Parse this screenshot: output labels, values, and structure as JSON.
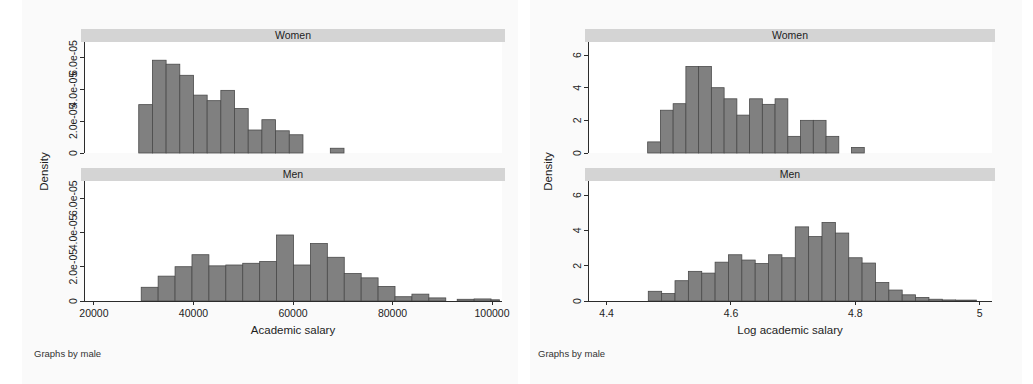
{
  "figure_left": {
    "note": "Graphs by male",
    "xlabel": "Academic salary",
    "ylabel": "Density",
    "panels": [
      {
        "title": "Women"
      },
      {
        "title": "Men"
      }
    ]
  },
  "figure_right": {
    "note": "Graphs by male",
    "xlabel": "Log academic salary",
    "ylabel": "Density",
    "panels": [
      {
        "title": "Women"
      },
      {
        "title": "Men"
      }
    ]
  },
  "colors": {
    "bar_fill": "#808080",
    "bar_stroke": "#4a4a4a",
    "strip": "#d4d4d4",
    "panel_bg": "#ffffff",
    "figure_bg": "#fafafa",
    "axis": "#2b2b2b"
  },
  "chart_data": [
    {
      "id": "salary-women",
      "type": "bar",
      "title": "Women",
      "subtitle": "Graphs by male",
      "xlabel": "Academic salary",
      "ylabel": "Density",
      "xlim": [
        18000,
        102000
      ],
      "ylim": [
        0,
        7e-05
      ],
      "xticks": [
        20000,
        40000,
        60000,
        80000,
        100000
      ],
      "xtick_labels": [
        "20000",
        "40000",
        "60000",
        "80000",
        "100000"
      ],
      "yticks": [
        0,
        2e-05,
        4e-05,
        6e-05
      ],
      "ytick_labels": [
        "0",
        "2.0e-05",
        "4.0e-05",
        "6.0e-05"
      ],
      "grid": false,
      "legend": "none",
      "bin_width": 2750,
      "bins": [
        {
          "x0": 29000,
          "x1": 31750,
          "density": 3.05e-05
        },
        {
          "x0": 31750,
          "x1": 34500,
          "density": 5.85e-05
        },
        {
          "x0": 34500,
          "x1": 37250,
          "density": 5.6e-05
        },
        {
          "x0": 37250,
          "x1": 40000,
          "density": 4.9e-05
        },
        {
          "x0": 40000,
          "x1": 42750,
          "density": 3.65e-05
        },
        {
          "x0": 42750,
          "x1": 45500,
          "density": 3.3e-05
        },
        {
          "x0": 45500,
          "x1": 48250,
          "density": 3.95e-05
        },
        {
          "x0": 48250,
          "x1": 51000,
          "density": 2.8e-05
        },
        {
          "x0": 51000,
          "x1": 53750,
          "density": 1.45e-05
        },
        {
          "x0": 53750,
          "x1": 56500,
          "density": 2.1e-05
        },
        {
          "x0": 56500,
          "x1": 59250,
          "density": 1.4e-05
        },
        {
          "x0": 59250,
          "x1": 62000,
          "density": 1.15e-05
        },
        {
          "x0": 67500,
          "x1": 70250,
          "density": 3e-06
        }
      ]
    },
    {
      "id": "salary-men",
      "type": "bar",
      "title": "Men",
      "subtitle": "Graphs by male",
      "xlabel": "Academic salary",
      "ylabel": "Density",
      "xlim": [
        18000,
        102000
      ],
      "ylim": [
        0,
        7e-05
      ],
      "xticks": [
        20000,
        40000,
        60000,
        80000,
        100000
      ],
      "xtick_labels": [
        "20000",
        "40000",
        "60000",
        "80000",
        "100000"
      ],
      "yticks": [
        0,
        2e-05,
        4e-05,
        6e-05
      ],
      "ytick_labels": [
        "0",
        "2.0e-05",
        "4.0e-05",
        "6.0e-05"
      ],
      "grid": false,
      "legend": "none",
      "bin_width": 3400,
      "bins": [
        {
          "x0": 29500,
          "x1": 32900,
          "density": 8e-06
        },
        {
          "x0": 32900,
          "x1": 36300,
          "density": 1.45e-05
        },
        {
          "x0": 36300,
          "x1": 39700,
          "density": 2e-05
        },
        {
          "x0": 39700,
          "x1": 43100,
          "density": 2.7e-05
        },
        {
          "x0": 43100,
          "x1": 46500,
          "density": 2.05e-05
        },
        {
          "x0": 46500,
          "x1": 49900,
          "density": 2.1e-05
        },
        {
          "x0": 49900,
          "x1": 53300,
          "density": 2.2e-05
        },
        {
          "x0": 53300,
          "x1": 56700,
          "density": 2.3e-05
        },
        {
          "x0": 56700,
          "x1": 60100,
          "density": 3.85e-05
        },
        {
          "x0": 60100,
          "x1": 63500,
          "density": 2.1e-05
        },
        {
          "x0": 63500,
          "x1": 66900,
          "density": 3.35e-05
        },
        {
          "x0": 66900,
          "x1": 70300,
          "density": 2.55e-05
        },
        {
          "x0": 70300,
          "x1": 73700,
          "density": 1.6e-05
        },
        {
          "x0": 73700,
          "x1": 77100,
          "density": 1.35e-05
        },
        {
          "x0": 77100,
          "x1": 80500,
          "density": 8.5e-06
        },
        {
          "x0": 80500,
          "x1": 83900,
          "density": 2.5e-06
        },
        {
          "x0": 83900,
          "x1": 87300,
          "density": 4e-06
        },
        {
          "x0": 87300,
          "x1": 90700,
          "density": 1.8e-06
        },
        {
          "x0": 93000,
          "x1": 96400,
          "density": 1e-06
        },
        {
          "x0": 96400,
          "x1": 99800,
          "density": 1.2e-06
        },
        {
          "x0": 99800,
          "x1": 101500,
          "density": 7e-07
        }
      ]
    },
    {
      "id": "logsalary-women",
      "type": "bar",
      "title": "Women",
      "subtitle": "Graphs by male",
      "xlabel": "Log academic salary",
      "ylabel": "Density",
      "xlim": [
        4.37,
        5.02
      ],
      "ylim": [
        0,
        6.8
      ],
      "xticks": [
        4.4,
        4.6,
        4.8,
        5.0
      ],
      "xtick_labels": [
        "4.4",
        "4.6",
        "4.8",
        "5"
      ],
      "yticks": [
        0,
        2,
        4,
        6
      ],
      "ytick_labels": [
        "0",
        "2",
        "4",
        "6"
      ],
      "grid": false,
      "legend": "none",
      "bin_width": 0.0205,
      "bins": [
        {
          "x0": 4.466,
          "x1": 4.4865,
          "density": 0.68
        },
        {
          "x0": 4.4865,
          "x1": 4.507,
          "density": 2.62
        },
        {
          "x0": 4.507,
          "x1": 4.5275,
          "density": 3.02
        },
        {
          "x0": 4.5275,
          "x1": 4.548,
          "density": 5.3
        },
        {
          "x0": 4.548,
          "x1": 4.5685,
          "density": 5.3
        },
        {
          "x0": 4.5685,
          "x1": 4.589,
          "density": 4.0
        },
        {
          "x0": 4.589,
          "x1": 4.6095,
          "density": 3.32
        },
        {
          "x0": 4.6095,
          "x1": 4.63,
          "density": 2.32
        },
        {
          "x0": 4.63,
          "x1": 4.6505,
          "density": 3.32
        },
        {
          "x0": 4.6505,
          "x1": 4.671,
          "density": 2.98
        },
        {
          "x0": 4.671,
          "x1": 4.6915,
          "density": 3.32
        },
        {
          "x0": 4.6915,
          "x1": 4.712,
          "density": 1.02
        },
        {
          "x0": 4.712,
          "x1": 4.7325,
          "density": 2.0
        },
        {
          "x0": 4.7325,
          "x1": 4.753,
          "density": 2.0
        },
        {
          "x0": 4.753,
          "x1": 4.7735,
          "density": 1.02
        },
        {
          "x0": 4.794,
          "x1": 4.8145,
          "density": 0.34
        }
      ]
    },
    {
      "id": "logsalary-men",
      "type": "bar",
      "title": "Men",
      "subtitle": "Graphs by male",
      "xlabel": "Log academic salary",
      "ylabel": "Density",
      "xlim": [
        4.37,
        5.02
      ],
      "ylim": [
        0,
        6.8
      ],
      "xticks": [
        4.4,
        4.6,
        4.8,
        5.0
      ],
      "xtick_labels": [
        "4.4",
        "4.6",
        "4.8",
        "5"
      ],
      "yticks": [
        0,
        2,
        4,
        6
      ],
      "ytick_labels": [
        "0",
        "2",
        "4",
        "6"
      ],
      "grid": false,
      "legend": "none",
      "bin_width": 0.0215,
      "bins": [
        {
          "x0": 4.467,
          "x1": 4.4885,
          "density": 0.55
        },
        {
          "x0": 4.4885,
          "x1": 4.51,
          "density": 0.42
        },
        {
          "x0": 4.51,
          "x1": 4.5315,
          "density": 1.15
        },
        {
          "x0": 4.5315,
          "x1": 4.553,
          "density": 1.68
        },
        {
          "x0": 4.553,
          "x1": 4.5745,
          "density": 1.58
        },
        {
          "x0": 4.5745,
          "x1": 4.596,
          "density": 2.2
        },
        {
          "x0": 4.596,
          "x1": 4.6175,
          "density": 2.62
        },
        {
          "x0": 4.6175,
          "x1": 4.639,
          "density": 2.32
        },
        {
          "x0": 4.639,
          "x1": 4.6605,
          "density": 2.12
        },
        {
          "x0": 4.6605,
          "x1": 4.682,
          "density": 2.62
        },
        {
          "x0": 4.682,
          "x1": 4.7035,
          "density": 2.45
        },
        {
          "x0": 4.7035,
          "x1": 4.725,
          "density": 4.2
        },
        {
          "x0": 4.725,
          "x1": 4.7465,
          "density": 3.65
        },
        {
          "x0": 4.7465,
          "x1": 4.768,
          "density": 4.45
        },
        {
          "x0": 4.768,
          "x1": 4.7895,
          "density": 3.85
        },
        {
          "x0": 4.7895,
          "x1": 4.811,
          "density": 2.45
        },
        {
          "x0": 4.811,
          "x1": 4.8325,
          "density": 2.15
        },
        {
          "x0": 4.8325,
          "x1": 4.854,
          "density": 1.05
        },
        {
          "x0": 4.854,
          "x1": 4.8755,
          "density": 0.62
        },
        {
          "x0": 4.8755,
          "x1": 4.897,
          "density": 0.35
        },
        {
          "x0": 4.897,
          "x1": 4.9185,
          "density": 0.2
        },
        {
          "x0": 4.9185,
          "x1": 4.94,
          "density": 0.1
        },
        {
          "x0": 4.94,
          "x1": 4.9615,
          "density": 0.06
        },
        {
          "x0": 4.9615,
          "x1": 4.995,
          "density": 0.05
        }
      ]
    }
  ]
}
